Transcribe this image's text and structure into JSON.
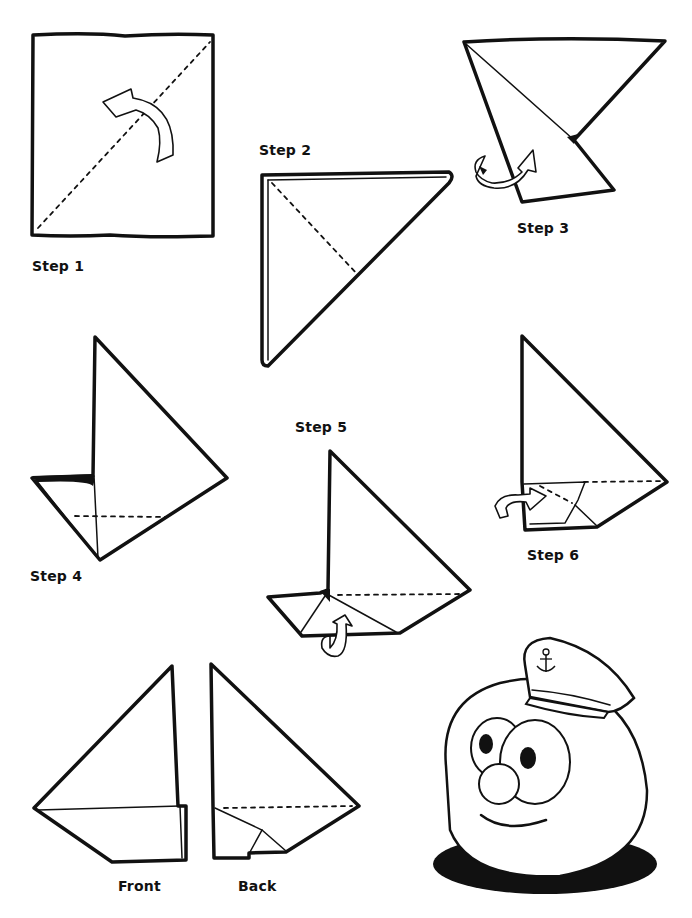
{
  "page": {
    "background": "#ffffff",
    "ink_color": "#111111"
  },
  "steps": [
    {
      "id": 1,
      "label": "Step 1",
      "instruction_icon": "curved-fold-arrow-icon",
      "fold_line": "diagonal-dashed"
    },
    {
      "id": 2,
      "label": "Step 2",
      "instruction_icon": null,
      "fold_line": "dashed"
    },
    {
      "id": 3,
      "label": "Step 3",
      "instruction_icon": "fold-behind-arrow-icon",
      "fold_line": null
    },
    {
      "id": 4,
      "label": "Step 4",
      "instruction_icon": null,
      "fold_line": "horizontal-dashed"
    },
    {
      "id": 5,
      "label": "Step 5",
      "instruction_icon": "fold-up-arrow-icon",
      "fold_line": "horizontal-dotted"
    },
    {
      "id": 6,
      "label": "Step 6",
      "instruction_icon": "fold-in-arrow-icon",
      "fold_line": "dotted"
    }
  ],
  "result": {
    "front_label": "Front",
    "back_label": "Back"
  },
  "character": {
    "name": "captain-character",
    "hat_emblem": "anchor-icon"
  }
}
